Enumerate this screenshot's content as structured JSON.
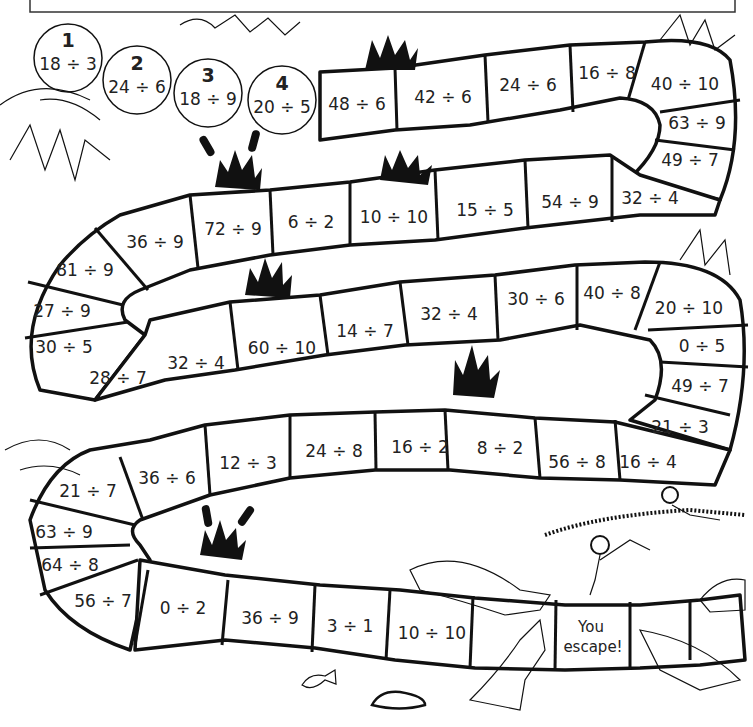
{
  "worksheet": {
    "title_box_text": "",
    "start_circles": [
      {
        "number": "1",
        "question": "18 ÷ 3"
      },
      {
        "number": "2",
        "question": "24 ÷ 6"
      },
      {
        "number": "3",
        "question": "18 ÷ 9"
      },
      {
        "number": "4",
        "question": "20 ÷ 5"
      }
    ],
    "path_cells": [
      "48 ÷ 6",
      "42 ÷ 6",
      "24 ÷ 6",
      "16 ÷ 8",
      "40 ÷ 10",
      "63 ÷ 9",
      "49 ÷ 7",
      "32 ÷ 4",
      "54 ÷ 9",
      "15 ÷ 5",
      "10 ÷ 10",
      "6 ÷ 2",
      "72 ÷ 9",
      "36 ÷ 9",
      "81 ÷ 9",
      "27 ÷ 9",
      "30 ÷ 5",
      "28 ÷ 7",
      "32 ÷ 4",
      "60 ÷ 10",
      "14 ÷ 7",
      "32 ÷ 4",
      "30 ÷ 6",
      "40 ÷ 8",
      "20 ÷ 10",
      "0 ÷ 5",
      "49 ÷ 7",
      "21 ÷ 3",
      "16 ÷ 4",
      "56 ÷ 8",
      "8 ÷ 2",
      "16 ÷ 2",
      "24 ÷ 8",
      "12 ÷ 3",
      "36 ÷ 6",
      "21 ÷ 7",
      "63 ÷ 9",
      "64 ÷ 8",
      "56 ÷ 7",
      "0 ÷ 2",
      "36 ÷ 9",
      "3 ÷ 1",
      "10 ÷ 10"
    ],
    "finish_cell": {
      "line1": "You",
      "line2": "escape!"
    },
    "illustrations": [
      "reeds",
      "bulrushes",
      "crocodiles",
      "explorers",
      "rope",
      "fish",
      "rock",
      "grass"
    ]
  }
}
